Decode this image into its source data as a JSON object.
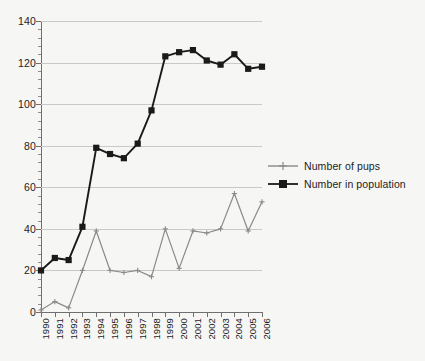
{
  "chart_data": {
    "type": "line",
    "title": "",
    "xlabel": "",
    "ylabel": "",
    "categories": [
      "1990",
      "1991",
      "1992",
      "1993",
      "1994",
      "1995",
      "1996",
      "1997",
      "1998",
      "1999",
      "2000",
      "2001",
      "2002",
      "2003",
      "2004",
      "2005",
      "2006"
    ],
    "ylim": [
      0,
      140
    ],
    "yticks": [
      0,
      20,
      40,
      60,
      80,
      100,
      120,
      140
    ],
    "ytick_labels": [
      "0",
      "20",
      "40",
      "60",
      "80",
      "100",
      "120",
      "140"
    ],
    "minor_tick_step": 4,
    "grid": "horizontal",
    "legend_position": "right",
    "series": [
      {
        "name": "Number of pups",
        "color": "#8a8a8a",
        "marker": "cross",
        "values": [
          1,
          5,
          2,
          20,
          39,
          20,
          19,
          20,
          17,
          40,
          21,
          39,
          38,
          40,
          57,
          39,
          53
        ]
      },
      {
        "name": "Number in population",
        "color": "#1a1a1a",
        "marker": "square",
        "values": [
          20,
          26,
          25,
          41,
          79,
          76,
          74,
          81,
          97,
          123,
          125,
          126,
          121,
          119,
          124,
          117,
          118
        ]
      }
    ]
  },
  "legend": {
    "items": [
      {
        "label": "Number of pups"
      },
      {
        "label": "Number in population"
      }
    ]
  },
  "colors": {
    "background": "#f6f6f5",
    "axis": "#6f6f6f",
    "gridline": "#c9c9c9",
    "text": "#1c1c1c",
    "pups": "#8a8a8a",
    "population": "#1a1a1a"
  }
}
